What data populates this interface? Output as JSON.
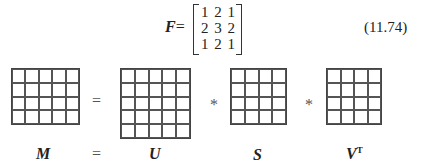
{
  "equation": {
    "lhs": "F",
    "equals": "=",
    "matrix_rows": [
      "1 2 1",
      "2 3 2",
      "1 2 1"
    ],
    "number": "(11.74)"
  },
  "svd_diagram": {
    "operators": [
      "=",
      "*",
      "*"
    ],
    "label_equals": "=",
    "matrices": [
      {
        "name": "M",
        "rows": 4,
        "cols": 5
      },
      {
        "name": "U",
        "rows": 5,
        "cols": 5
      },
      {
        "name": "S",
        "rows": 4,
        "cols": 4
      },
      {
        "name": "V",
        "superscript": "T",
        "rows": 4,
        "cols": 4
      }
    ]
  }
}
